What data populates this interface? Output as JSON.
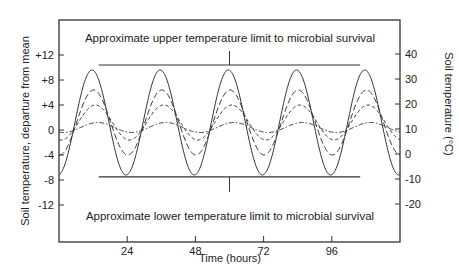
{
  "chart_data": {
    "type": "line",
    "title": "",
    "xlabel": "Time (hours)",
    "ylabel": "Soil temperature, departure from mean",
    "ylabel_right": "Soil temperature (°C)",
    "xlim": [
      0,
      120
    ],
    "ylim": [
      -18,
      18
    ],
    "ylim_right": [
      -35,
      55
    ],
    "x_ticks": [
      24,
      48,
      72,
      96
    ],
    "x_tick_labels": [
      "24",
      "48",
      "72",
      "96"
    ],
    "y_ticks": [
      12,
      8,
      4,
      0,
      -4,
      -8,
      -12
    ],
    "y_tick_labels": [
      "+12",
      "+8",
      "+4",
      "0",
      "-4",
      "-8",
      "-12"
    ],
    "y_right_ticks": [
      40,
      30,
      20,
      10,
      0,
      -10,
      -20
    ],
    "y_right_tick_labels": [
      "40",
      "30",
      "20",
      "10",
      "0",
      "-10",
      "-20"
    ],
    "grid": false,
    "legend": "none",
    "period_hours": 24,
    "series": [
      {
        "name": "surface",
        "style": "solid",
        "mean_offset": 1.2,
        "amplitude": 8.4,
        "peak_hour": 11.6
      },
      {
        "name": "shallow depth",
        "style": "long-dash",
        "mean_offset": 1.2,
        "amplitude": 5.2,
        "peak_hour": 12.2
      },
      {
        "name": "intermediate depth",
        "style": "short-dash",
        "mean_offset": 1.2,
        "amplitude": 2.8,
        "peak_hour": 12.8
      },
      {
        "name": "deep",
        "style": "dash-dot",
        "mean_offset": 0.4,
        "amplitude": 0.8,
        "peak_hour": 13.6
      }
    ],
    "annotations": [
      {
        "text": "Approximate upper temperature limit to microbial survival",
        "y": 10.4,
        "x_range": [
          14,
          106
        ],
        "marker_x": 60
      },
      {
        "text": "Approximate lower temperature limit to microbial survival",
        "y": -7.5,
        "x_range": [
          14,
          106
        ],
        "marker_x": 60
      }
    ]
  }
}
